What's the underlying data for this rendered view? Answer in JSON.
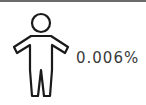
{
  "stat": {
    "icon": "person-icon",
    "value": "0.006%"
  },
  "colors": {
    "stroke": "#1a1a1a",
    "text": "#3a3a3a",
    "top_rule": "#6a6a6a"
  }
}
